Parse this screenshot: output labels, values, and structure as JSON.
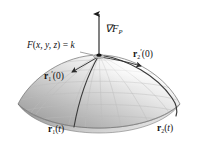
{
  "figure": {
    "background_color": "#ffffff",
    "ink_color": "#111111"
  },
  "labels": {
    "gradient": {
      "symbol": "∇",
      "func": "F",
      "point_sub": "P"
    },
    "level_surface": {
      "func": "F",
      "open": "(",
      "vars": "x, y, z",
      "close": ")",
      "eq": " = ",
      "value": "k"
    },
    "tangent_1": {
      "vec": "r",
      "index": "1",
      "prime": "′",
      "arg": "(0)"
    },
    "tangent_2": {
      "vec": "r",
      "index": "2",
      "prime": "′",
      "arg": "(0)"
    },
    "curve_1": {
      "vec": "r",
      "index": "1",
      "arg_open": "(",
      "arg": "t",
      "arg_close": ")"
    },
    "curve_2": {
      "vec": "r",
      "index": "2",
      "arg_open": "(",
      "arg": "t",
      "arg_close": ")"
    }
  },
  "surface": {
    "shape": "dome",
    "fill_light": "#fdfdfd",
    "fill_mid": "#d8d8d8",
    "fill_dark": "#9a9a9a",
    "rim_color": "#6e6e6e",
    "mesh_color": "#b9b9b9"
  },
  "vectors": {
    "gradient_color": "#1a1a1a",
    "tangent_color": "#2a2a2a",
    "curve_color": "#3a3a3a",
    "point_color": "#141414"
  }
}
